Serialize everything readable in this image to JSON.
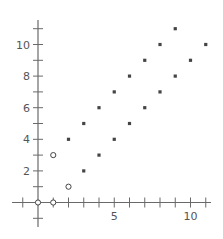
{
  "chart_data": {
    "type": "scatter",
    "title": "",
    "xlabel": "",
    "ylabel": "",
    "xlim": [
      -1.7,
      11.4
    ],
    "ylim": [
      -1.6,
      11.6
    ],
    "grid": false,
    "legend": null,
    "x_tick_values": [
      -1,
      0,
      1,
      2,
      3,
      4,
      5,
      6,
      7,
      8,
      9,
      10,
      11
    ],
    "y_tick_values": [
      -1,
      0,
      1,
      2,
      3,
      4,
      5,
      6,
      7,
      8,
      9,
      10,
      11
    ],
    "x_tick_labels": [
      {
        "value": 5,
        "label": "5"
      },
      {
        "value": 10,
        "label": "10"
      }
    ],
    "y_tick_labels": [
      {
        "value": 2,
        "label": "2"
      },
      {
        "value": 4,
        "label": "4"
      },
      {
        "value": 6,
        "label": "6"
      },
      {
        "value": 8,
        "label": "8"
      },
      {
        "value": 10,
        "label": "10"
      }
    ],
    "series": [
      {
        "name": "open-circles",
        "marker": "circle-open",
        "points": [
          [
            0,
            0
          ],
          [
            1,
            0
          ],
          [
            1,
            3
          ],
          [
            2,
            1
          ]
        ]
      },
      {
        "name": "filled-squares",
        "marker": "square-filled",
        "points": [
          [
            2,
            4
          ],
          [
            3,
            2
          ],
          [
            3,
            5
          ],
          [
            4,
            3
          ],
          [
            4,
            6
          ],
          [
            5,
            4
          ],
          [
            5,
            7
          ],
          [
            6,
            5
          ],
          [
            6,
            8
          ],
          [
            7,
            6
          ],
          [
            7,
            9
          ],
          [
            8,
            7
          ],
          [
            8,
            10
          ],
          [
            9,
            8
          ],
          [
            9,
            11
          ],
          [
            10,
            9
          ],
          [
            11,
            10
          ]
        ]
      }
    ]
  },
  "style": {
    "axis_color": "#6a6a6a",
    "marker_color": "#444444",
    "label_color": "#555555",
    "background": "#ffffff"
  },
  "layout": {
    "origin_px": [
      38,
      202.5
    ],
    "x_px_per_unit": 15.25,
    "y_px_per_unit": 15.8,
    "x_axis_px": [
      12,
      211
    ],
    "y_axis_px": [
      20,
      227
    ],
    "tick_half_len": 5
  }
}
